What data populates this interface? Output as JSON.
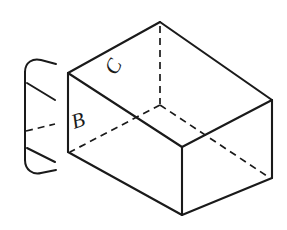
{
  "figure": {
    "background_color": "#ffffff",
    "line_color": "#1a1a1a",
    "stroke_width": 2.0,
    "hidden_stroke_width": 1.6,
    "hidden_dash_pattern": "7,5",
    "labels": [
      {
        "id": "label-b",
        "text": "B",
        "x": 74,
        "y": 129,
        "rotation": -18,
        "font_size": 22,
        "face": "left-inner-face"
      },
      {
        "id": "label-c",
        "text": "C",
        "x": 116,
        "y": 76,
        "rotation": -62,
        "font_size": 21,
        "face": "back-inner-face"
      }
    ],
    "geometry": {
      "top_apex": {
        "x": 160,
        "y": 22
      },
      "top_left": {
        "x": 68,
        "y": 73
      },
      "top_right": {
        "x": 272,
        "y": 100
      },
      "bottom_left": {
        "x": 68,
        "y": 152
      },
      "bottom_right": {
        "x": 272,
        "y": 178
      },
      "bottom_front": {
        "x": 182,
        "y": 215
      },
      "inner_back": {
        "x": 160,
        "y": 105
      },
      "inner_front": {
        "x": 182,
        "y": 147
      },
      "break_symbol_x_range": [
        18,
        56
      ]
    }
  },
  "view": {
    "width": 287,
    "height": 230
  }
}
